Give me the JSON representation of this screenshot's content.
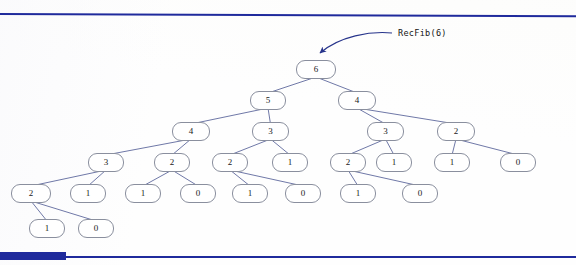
{
  "slide": {
    "background_color": "#fefefe",
    "rule_color": "#1f2a9c",
    "node_border_color": "#8a8f9e",
    "edge_color": "#4a5590",
    "arrow_color": "#27348b"
  },
  "callout": {
    "label": "RecFib(6)",
    "arrow_name": "curved-arrow-to-root"
  },
  "decorations": {
    "top_rule_name": "top-divider-rule",
    "bottom_rule_name": "bottom-divider-rule",
    "bottom_block_name": "bottom-left-accent-block"
  },
  "tree": {
    "title": "RecFib(6) recursion call tree",
    "root_value": "6",
    "levels": [
      {
        "index": 1,
        "y": 70,
        "nodes": [
          {
            "id": "n6",
            "label": "6",
            "x": 296,
            "y": 60,
            "w": 40,
            "h": 19
          }
        ]
      },
      {
        "index": 2,
        "y": 101,
        "nodes": [
          {
            "id": "n5",
            "label": "5",
            "x": 250,
            "y": 91,
            "w": 36,
            "h": 19
          },
          {
            "id": "n4r",
            "label": "4",
            "x": 338,
            "y": 91,
            "w": 38,
            "h": 19
          }
        ]
      },
      {
        "index": 3,
        "y": 131,
        "nodes": [
          {
            "id": "n4l",
            "label": "4",
            "x": 172,
            "y": 122,
            "w": 38,
            "h": 19
          },
          {
            "id": "n3a",
            "label": "3",
            "x": 252,
            "y": 122,
            "w": 37,
            "h": 19
          },
          {
            "id": "n3b",
            "label": "3",
            "x": 367,
            "y": 122,
            "w": 37,
            "h": 19
          },
          {
            "id": "n2top",
            "label": "2",
            "x": 437,
            "y": 122,
            "w": 38,
            "h": 19
          }
        ]
      },
      {
        "index": 4,
        "y": 162,
        "nodes": [
          {
            "id": "n3c",
            "label": "3",
            "x": 88,
            "y": 153,
            "w": 36,
            "h": 19
          },
          {
            "id": "n2a",
            "label": "2",
            "x": 154,
            "y": 153,
            "w": 36,
            "h": 19
          },
          {
            "id": "n2b",
            "label": "2",
            "x": 212,
            "y": 153,
            "w": 36,
            "h": 19
          },
          {
            "id": "n1a",
            "label": "1",
            "x": 272,
            "y": 153,
            "w": 36,
            "h": 19
          },
          {
            "id": "n2c",
            "label": "2",
            "x": 330,
            "y": 153,
            "w": 36,
            "h": 19
          },
          {
            "id": "n1b",
            "label": "1",
            "x": 376,
            "y": 153,
            "w": 36,
            "h": 19
          },
          {
            "id": "n1c",
            "label": "1",
            "x": 434,
            "y": 153,
            "w": 36,
            "h": 19
          },
          {
            "id": "n0a",
            "label": "0",
            "x": 500,
            "y": 153,
            "w": 36,
            "h": 19
          }
        ]
      },
      {
        "index": 5,
        "y": 193,
        "nodes": [
          {
            "id": "n2d",
            "label": "2",
            "x": 11,
            "y": 184,
            "w": 40,
            "h": 19
          },
          {
            "id": "n1d",
            "label": "1",
            "x": 70,
            "y": 184,
            "w": 36,
            "h": 19
          },
          {
            "id": "n1e",
            "label": "1",
            "x": 125,
            "y": 184,
            "w": 36,
            "h": 19
          },
          {
            "id": "n0b",
            "label": "0",
            "x": 180,
            "y": 184,
            "w": 36,
            "h": 19
          },
          {
            "id": "n1f",
            "label": "1",
            "x": 232,
            "y": 184,
            "w": 36,
            "h": 19
          },
          {
            "id": "n0c",
            "label": "0",
            "x": 285,
            "y": 184,
            "w": 36,
            "h": 19
          },
          {
            "id": "n1g",
            "label": "1",
            "x": 340,
            "y": 184,
            "w": 36,
            "h": 19
          },
          {
            "id": "n0d",
            "label": "0",
            "x": 402,
            "y": 184,
            "w": 36,
            "h": 19
          }
        ]
      },
      {
        "index": 6,
        "y": 228,
        "nodes": [
          {
            "id": "n1h",
            "label": "1",
            "x": 29,
            "y": 219,
            "w": 36,
            "h": 19
          },
          {
            "id": "n0e",
            "label": "0",
            "x": 78,
            "y": 219,
            "w": 36,
            "h": 19
          }
        ]
      }
    ],
    "edges": [
      {
        "from": "n6",
        "to": "n5"
      },
      {
        "from": "n6",
        "to": "n4r"
      },
      {
        "from": "n5",
        "to": "n4l"
      },
      {
        "from": "n5",
        "to": "n3a"
      },
      {
        "from": "n4r",
        "to": "n3b"
      },
      {
        "from": "n4r",
        "to": "n2top"
      },
      {
        "from": "n4l",
        "to": "n3c"
      },
      {
        "from": "n4l",
        "to": "n2a"
      },
      {
        "from": "n3a",
        "to": "n2b"
      },
      {
        "from": "n3a",
        "to": "n1a"
      },
      {
        "from": "n3b",
        "to": "n2c"
      },
      {
        "from": "n3b",
        "to": "n1b"
      },
      {
        "from": "n2top",
        "to": "n1c"
      },
      {
        "from": "n2top",
        "to": "n0a"
      },
      {
        "from": "n3c",
        "to": "n2d"
      },
      {
        "from": "n3c",
        "to": "n1d"
      },
      {
        "from": "n2a",
        "to": "n1e"
      },
      {
        "from": "n2a",
        "to": "n0b"
      },
      {
        "from": "n2b",
        "to": "n1f"
      },
      {
        "from": "n2b",
        "to": "n0c"
      },
      {
        "from": "n2c",
        "to": "n1g"
      },
      {
        "from": "n2c",
        "to": "n0d"
      },
      {
        "from": "n2d",
        "to": "n1h"
      },
      {
        "from": "n2d",
        "to": "n0e"
      }
    ]
  }
}
